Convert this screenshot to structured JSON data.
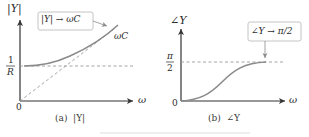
{
  "figure": {
    "panels": [
      {
        "id": "a",
        "caption": "(a)  |Y|",
        "y_axis_label": "|Y|",
        "x_axis_label": "ω",
        "origin_label": "0",
        "level_label_num": "1",
        "level_label_den": "R",
        "asymptote_label": "ωC",
        "callout": "|Y| → ωC"
      },
      {
        "id": "b",
        "caption": "(b)  ∠Y",
        "y_axis_label": "∠Y",
        "x_axis_label": "ω",
        "origin_label": "0",
        "level_label_num": "π",
        "level_label_den": "2",
        "callout": "∠Y → π/2"
      }
    ],
    "colors": {
      "axis": "#333333",
      "curve": "#8a8a8a",
      "dashed": "#9a9a9a",
      "callout_border": "#bdbdbd"
    }
  }
}
